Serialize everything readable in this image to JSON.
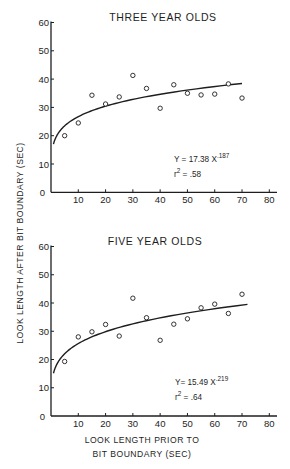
{
  "figure": {
    "y_axis_label": "LOOK LENGTH AFTER BIT BOUNDARY (SEC)",
    "x_axis_label_line1": "LOOK LENGTH PRIOR TO",
    "x_axis_label_line2": "BIT BOUNDARY (SEC)"
  },
  "panels": [
    {
      "title": "THREE YEAR OLDS",
      "equation_prefix": "Y = 17.38 X",
      "equation_exponent": ".187",
      "r2_prefix": "r",
      "r2_sup": "2",
      "r2_value": " = .58"
    },
    {
      "title": "FIVE YEAR OLDS",
      "equation_prefix": "Y= 15.49 X",
      "equation_exponent": ".219",
      "r2_prefix": "r",
      "r2_sup": "2",
      "r2_value": " = .64"
    }
  ],
  "chart_data": [
    {
      "type": "scatter",
      "title": "THREE YEAR OLDS",
      "xlabel": "LOOK LENGTH PRIOR TO BIT BOUNDARY (SEC)",
      "ylabel": "LOOK LENGTH AFTER BIT BOUNDARY (SEC)",
      "xlim": [
        0,
        80
      ],
      "ylim": [
        0,
        60
      ],
      "x_ticks": [
        10,
        20,
        30,
        40,
        50,
        60,
        70,
        80
      ],
      "y_ticks": [
        0,
        10,
        20,
        30,
        40,
        50,
        60
      ],
      "grid": false,
      "series": [
        {
          "name": "observed",
          "marker": "open-circle",
          "x": [
            5,
            10,
            15,
            20,
            25,
            30,
            35,
            40,
            45,
            50,
            55,
            60,
            65,
            70
          ],
          "y": [
            20,
            24.5,
            34.3,
            31.2,
            33.7,
            41.3,
            36.7,
            29.7,
            38,
            35,
            34.4,
            34.7,
            38.3,
            33.3
          ]
        },
        {
          "name": "fit",
          "type": "line",
          "model": "power",
          "a": 17.38,
          "b": 0.187,
          "x_range": [
            0.9,
            70
          ],
          "equation": "Y = 17.38 X^.187",
          "r_squared": 0.58
        }
      ],
      "annotations": [
        "Y = 17.38 X^.187",
        "r^2 = .58"
      ]
    },
    {
      "type": "scatter",
      "title": "FIVE YEAR OLDS",
      "xlabel": "LOOK LENGTH PRIOR TO BIT BOUNDARY (SEC)",
      "ylabel": "LOOK LENGTH AFTER BIT BOUNDARY (SEC)",
      "xlim": [
        0,
        80
      ],
      "ylim": [
        0,
        60
      ],
      "x_ticks": [
        10,
        20,
        30,
        40,
        50,
        60,
        70,
        80
      ],
      "y_ticks": [
        0,
        10,
        20,
        30,
        40,
        50,
        60
      ],
      "grid": false,
      "series": [
        {
          "name": "observed",
          "marker": "open-circle",
          "x": [
            5,
            10,
            15,
            20,
            25,
            30,
            35,
            40,
            45,
            50,
            55,
            60,
            65,
            70
          ],
          "y": [
            19.3,
            28,
            29.8,
            32.4,
            28.3,
            41.7,
            34.8,
            26.8,
            32.5,
            34.4,
            38.3,
            39.6,
            36.3,
            43.1
          ]
        },
        {
          "name": "fit",
          "type": "line",
          "model": "power",
          "a": 15.49,
          "b": 0.219,
          "x_range": [
            0.9,
            72
          ],
          "equation": "Y = 15.49 X^.219",
          "r_squared": 0.64
        }
      ],
      "annotations": [
        "Y = 15.49 X^.219",
        "r^2 = .64"
      ]
    }
  ]
}
